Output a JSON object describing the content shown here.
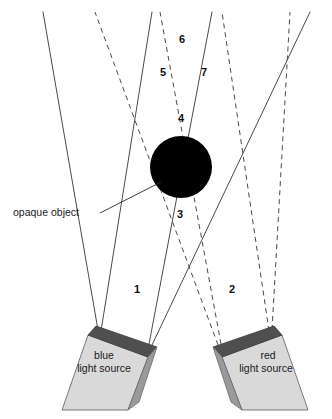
{
  "figure": {
    "type": "optics-ray-diagram",
    "background_color": "#ffffff",
    "object": {
      "name": "opaque object",
      "shape": "circle",
      "color": "#000000",
      "callout_label": "opaque object"
    },
    "sources": [
      {
        "id": "blue",
        "line_1": "blue",
        "line_2": "light source",
        "ray_style": "solid",
        "body_color": "#d9d9d9",
        "top_face_color": "#4f4f4f",
        "side_face_color": "#9a9a9a"
      },
      {
        "id": "red",
        "line_1": "red",
        "line_2": "light source",
        "ray_style": "dashed",
        "body_color": "#d9d9d9",
        "top_face_color": "#4f4f4f",
        "side_face_color": "#9a9a9a"
      }
    ],
    "region_labels": [
      "1",
      "2",
      "3",
      "4",
      "5",
      "6",
      "7"
    ],
    "ray_color": "#4a4a4a"
  },
  "regions": {
    "r1": "1",
    "r2": "2",
    "r3": "3",
    "r4": "4",
    "r5": "5",
    "r6": "6",
    "r7": "7"
  },
  "callout": {
    "opaque_object": "opaque object"
  },
  "blue_source": {
    "line1": "blue",
    "line2": "light source"
  },
  "red_source": {
    "line1": "red",
    "line2": "light source"
  }
}
